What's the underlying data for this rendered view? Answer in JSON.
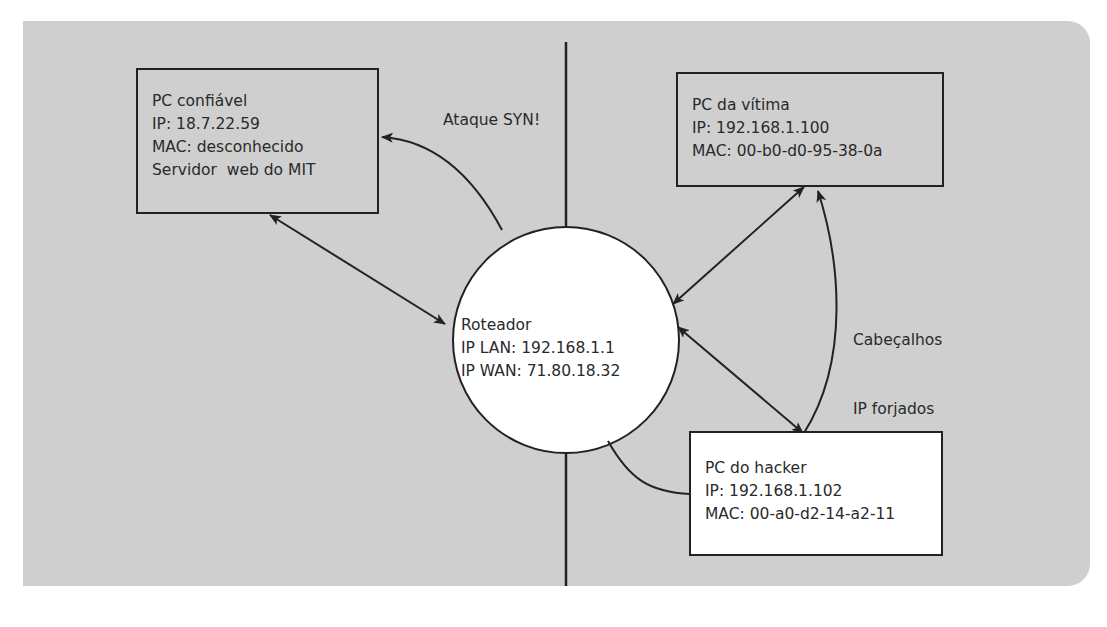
{
  "diagram": {
    "colors": {
      "panel_bg": "#cfcfcf",
      "page_bg": "#ffffff",
      "line": "#222222",
      "router_fill": "#ffffff",
      "hacker_box_fill": "#ffffff"
    },
    "nodes": {
      "trusted_pc": {
        "lines": [
          "PC confiável",
          "IP: 18.7.22.59",
          "MAC: desconhecido",
          "Servidor  web do MIT"
        ]
      },
      "victim_pc": {
        "lines": [
          "PC da vítima",
          "IP: 192.168.1.100",
          "MAC: 00-b0-d0-95-38-0a"
        ]
      },
      "router": {
        "lines": [
          "Roteador",
          "IP LAN: 192.168.1.1",
          "IP WAN: 71.80.18.32"
        ]
      },
      "hacker_pc": {
        "lines": [
          "PC do hacker",
          "IP: 192.168.1.102",
          "MAC: 00-a0-d2-14-a2-11"
        ]
      }
    },
    "edge_labels": {
      "syn_attack": "Ataque SYN!",
      "forged_headers": [
        "Cabeçalhos",
        "IP forjados"
      ]
    },
    "edges": [
      {
        "from": "router",
        "to": "trusted_pc",
        "type": "bidirectional"
      },
      {
        "from": "router",
        "to": "victim_pc",
        "type": "bidirectional"
      },
      {
        "from": "router",
        "to": "hacker_pc",
        "type": "bidirectional"
      },
      {
        "from": "router",
        "to": "trusted_pc",
        "type": "curved-arrow",
        "label": "Ataque SYN!"
      },
      {
        "from": "hacker_pc",
        "to": "victim_pc",
        "type": "curved-arrow",
        "label": "Cabeçalhos IP forjados"
      },
      {
        "from": "hacker_pc",
        "to": "router",
        "type": "curved-line"
      }
    ]
  }
}
